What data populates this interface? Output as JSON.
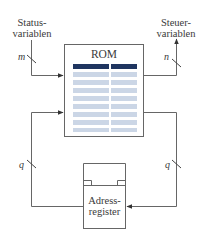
{
  "diagram": {
    "rom_box": {
      "label": "ROM"
    },
    "address_register": {
      "line1": "Adress-",
      "line2": "register"
    },
    "inputs": {
      "line1": "Status-",
      "line2": "variablen",
      "bus_width": "m"
    },
    "outputs": {
      "line1": "Steuer-",
      "line2": "variablen",
      "bus_width": "n"
    },
    "feedback_left": {
      "bus_width": "q"
    },
    "feedback_right": {
      "bus_width": "q"
    },
    "colors": {
      "line": "#555555",
      "rom_header": "#1f3560",
      "rom_row": "#cbd6e6"
    }
  }
}
